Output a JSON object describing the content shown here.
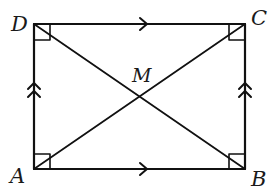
{
  "diagram": {
    "type": "geometry-figure",
    "shape": "rectangle",
    "stroke_color": "#111111",
    "background": "#ffffff",
    "vertices": [
      {
        "name": "A",
        "position": "bottom-left"
      },
      {
        "name": "B",
        "position": "bottom-right"
      },
      {
        "name": "C",
        "position": "top-right"
      },
      {
        "name": "D",
        "position": "top-left"
      }
    ],
    "intersection_point": {
      "name": "M",
      "description": "intersection of diagonals AC and BD"
    },
    "segments": [
      "AB",
      "BC",
      "CD",
      "DA",
      "AC",
      "BD"
    ],
    "markings": {
      "right_angles": [
        "A",
        "B",
        "C",
        "D"
      ],
      "parallel_single_arrow": [
        "DC",
        "AB"
      ],
      "parallel_double_arrow": [
        "AD",
        "BC"
      ]
    }
  },
  "labels": {
    "A": "A",
    "B": "B",
    "C": "C",
    "D": "D",
    "M": "M"
  }
}
